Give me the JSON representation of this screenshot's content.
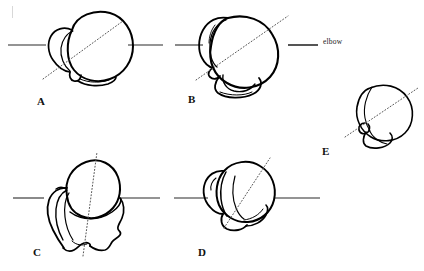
{
  "figure": {
    "kind": "anatomical-line-drawing",
    "background_color": "#ffffff",
    "ink_color": "#000000",
    "reference_line_color": "#2b2b2b",
    "axis_line_color": "#555555",
    "axis_line_style": "dotted",
    "panels": [
      {
        "id": "A",
        "label": "A",
        "label_x": 37,
        "label_y": 96,
        "reference_line": {
          "x1": 8,
          "y1": 45,
          "x2": 163,
          "y2": 45
        },
        "axis_line": {
          "x1": 43,
          "y1": 79,
          "x2": 123,
          "y2": 21
        },
        "head_center_x": 92,
        "head_center_y": 47
      },
      {
        "id": "B",
        "label": "B",
        "label_x": 188,
        "label_y": 94,
        "reference_line": {
          "x1": 175,
          "y1": 45,
          "x2": 318,
          "y2": 45
        },
        "axis_line": {
          "x1": 196,
          "y1": 80,
          "x2": 288,
          "y2": 16
        },
        "head_center_x": 243,
        "head_center_y": 50
      },
      {
        "id": "C",
        "label": "C",
        "label_x": 33,
        "label_y": 247,
        "reference_line": {
          "x1": 13,
          "y1": 198,
          "x2": 160,
          "y2": 198
        },
        "axis_line": {
          "x1": 83,
          "y1": 256,
          "x2": 97,
          "y2": 152
        },
        "head_center_x": 88,
        "head_center_y": 200
      },
      {
        "id": "D",
        "label": "D",
        "label_x": 198,
        "label_y": 247,
        "reference_line": {
          "x1": 174,
          "y1": 198,
          "x2": 320,
          "y2": 198
        },
        "axis_line": {
          "x1": 224,
          "y1": 228,
          "x2": 270,
          "y2": 158
        },
        "head_center_x": 240,
        "head_center_y": 196
      },
      {
        "id": "E",
        "label": "E",
        "label_x": 322,
        "label_y": 146,
        "reference_line": null,
        "axis_line": {
          "x1": 345,
          "y1": 137,
          "x2": 418,
          "y2": 88
        },
        "head_center_x": 378,
        "head_center_y": 115
      }
    ],
    "annotations": [
      {
        "id": "elbow",
        "text": "elbow",
        "x": 323,
        "y": 38,
        "leader_line": {
          "x1": 288,
          "y1": 45,
          "x2": 318,
          "y2": 45
        }
      }
    ]
  }
}
